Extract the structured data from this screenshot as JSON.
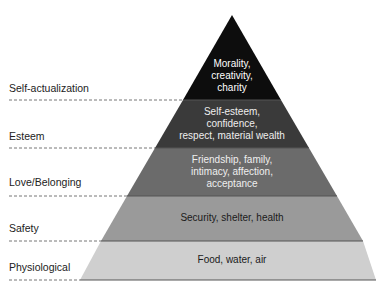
{
  "diagram": {
    "type": "pyramid",
    "levels": [
      {
        "name": "Self-actualization",
        "lines": [
          "Morality,",
          "creativity,",
          "charity"
        ],
        "fill": "#0d0d0d",
        "text_color": "#ffffff"
      },
      {
        "name": "Esteem",
        "lines": [
          "Self-esteem,",
          "confidence,",
          "respect, material wealth"
        ],
        "fill": "#3a3a3a",
        "text_color": "#eeeeee"
      },
      {
        "name": "Love/Belonging",
        "lines": [
          "Friendship, family,",
          "intimacy, affection,",
          "acceptance"
        ],
        "fill": "#6b6b6b",
        "text_color": "#efefef"
      },
      {
        "name": "Safety",
        "lines": [
          "Security, shelter, health"
        ],
        "fill": "#9a9a9a",
        "text_color": "#1a1a1a"
      },
      {
        "name": "Physiological",
        "lines": [
          "Food, water, air"
        ],
        "fill": "#cfcfcf",
        "text_color": "#1a1a1a"
      }
    ]
  }
}
